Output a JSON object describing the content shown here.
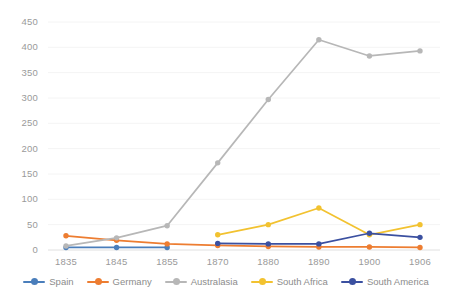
{
  "chart_data": {
    "type": "line",
    "title": "",
    "xlabel": "",
    "ylabel": "",
    "categories": [
      "1835",
      "1845",
      "1855",
      "1870",
      "1880",
      "1890",
      "1900",
      "1906"
    ],
    "x_tick_labels": [
      "1835",
      "1845",
      "1855",
      "1870",
      "1880",
      "1890",
      "1900",
      "1906"
    ],
    "y_tick_labels": [
      "0",
      "50",
      "100",
      "150",
      "200",
      "250",
      "300",
      "350",
      "400",
      "450"
    ],
    "y_ticks": [
      0,
      50,
      100,
      150,
      200,
      250,
      300,
      350,
      400,
      450
    ],
    "ylim": [
      0,
      450
    ],
    "grid": false,
    "legend_position": "bottom",
    "series": [
      {
        "name": "Spain",
        "color": "#4a7ebb",
        "values": [
          5,
          5,
          5,
          null,
          null,
          null,
          null,
          null
        ]
      },
      {
        "name": "Germany",
        "color": "#ed7d31",
        "values": [
          28,
          19,
          12,
          9,
          7,
          6,
          6,
          5
        ]
      },
      {
        "name": "Australasia",
        "color": "#b7b7b7",
        "values": [
          8,
          24,
          48,
          172,
          297,
          415,
          383,
          393
        ]
      },
      {
        "name": "South Africa",
        "color": "#f2c230",
        "values": [
          null,
          null,
          null,
          30,
          50,
          83,
          30,
          50
        ]
      },
      {
        "name": "South America",
        "color": "#3b50a0",
        "values": [
          null,
          null,
          null,
          13,
          12,
          12,
          33,
          25
        ]
      }
    ]
  },
  "legend": {
    "items": [
      {
        "label": "Spain",
        "color": "#4a7ebb"
      },
      {
        "label": "Germany",
        "color": "#ed7d31"
      },
      {
        "label": "Australasia",
        "color": "#b7b7b7"
      },
      {
        "label": "South Africa",
        "color": "#f2c230"
      },
      {
        "label": "South America",
        "color": "#3b50a0"
      }
    ]
  },
  "axes": {
    "y_labels": [
      "450",
      "400",
      "350",
      "300",
      "250",
      "200",
      "150",
      "100",
      "50",
      "0"
    ],
    "x_labels": [
      "1835",
      "1845",
      "1855",
      "1870",
      "1880",
      "1890",
      "1900",
      "1906"
    ]
  }
}
